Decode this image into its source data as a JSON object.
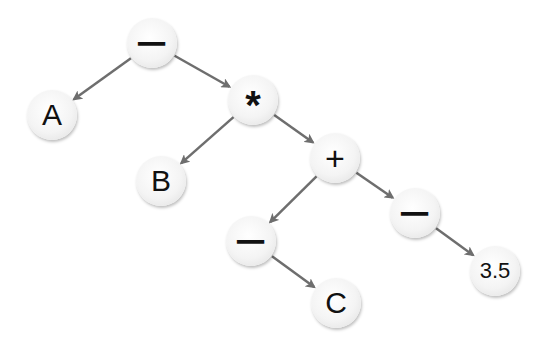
{
  "tree": {
    "nodes": [
      {
        "id": "root",
        "label": "−",
        "kind": "op-minus",
        "x": 152,
        "y": 43
      },
      {
        "id": "a",
        "label": "A",
        "kind": "leaf",
        "x": 52,
        "y": 115
      },
      {
        "id": "mul",
        "label": "*",
        "kind": "op-star",
        "x": 253,
        "y": 100
      },
      {
        "id": "b",
        "label": "B",
        "kind": "leaf",
        "x": 161,
        "y": 181
      },
      {
        "id": "plus",
        "label": "+",
        "kind": "op-plus",
        "x": 335,
        "y": 158
      },
      {
        "id": "neg_left",
        "label": "−",
        "kind": "op-minus",
        "x": 251,
        "y": 241
      },
      {
        "id": "neg_right",
        "label": "−",
        "kind": "op-minus",
        "x": 415,
        "y": 213
      },
      {
        "id": "c",
        "label": "C",
        "kind": "leaf",
        "x": 336,
        "y": 303
      },
      {
        "id": "num",
        "label": "3.5",
        "kind": "leaf-small",
        "x": 495,
        "y": 271
      }
    ],
    "edges": [
      {
        "from": "root",
        "to": "a"
      },
      {
        "from": "root",
        "to": "mul"
      },
      {
        "from": "mul",
        "to": "b"
      },
      {
        "from": "mul",
        "to": "plus"
      },
      {
        "from": "plus",
        "to": "neg_left"
      },
      {
        "from": "plus",
        "to": "neg_right"
      },
      {
        "from": "neg_left",
        "to": "c"
      },
      {
        "from": "neg_right",
        "to": "num"
      }
    ],
    "edge_color": "#6e6e6e"
  }
}
